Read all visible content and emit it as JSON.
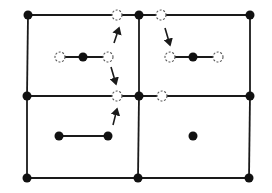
{
  "diagram": {
    "colors": {
      "line": "#1a1a1a",
      "filled_node": "#111111",
      "hollow_node_stroke": "#555555",
      "background": "#ffffff"
    },
    "grid_nodes": [
      {
        "id": "tl",
        "x": 28,
        "y": 15
      },
      {
        "id": "tc",
        "x": 139,
        "y": 15
      },
      {
        "id": "tr",
        "x": 250,
        "y": 15
      },
      {
        "id": "ml",
        "x": 27,
        "y": 96
      },
      {
        "id": "mc",
        "x": 139,
        "y": 96
      },
      {
        "id": "mr",
        "x": 250,
        "y": 96
      },
      {
        "id": "bl",
        "x": 27,
        "y": 178
      },
      {
        "id": "bc",
        "x": 138,
        "y": 178
      },
      {
        "id": "br",
        "x": 249,
        "y": 178
      }
    ],
    "grid_edges": [
      [
        "tl",
        "tc"
      ],
      [
        "tc",
        "tr"
      ],
      [
        "ml",
        "mc"
      ],
      [
        "mc",
        "mr"
      ],
      [
        "bl",
        "bc"
      ],
      [
        "bc",
        "br"
      ],
      [
        "tl",
        "ml"
      ],
      [
        "ml",
        "bl"
      ],
      [
        "tc",
        "mc"
      ],
      [
        "mc",
        "bc"
      ],
      [
        "tr",
        "mr"
      ],
      [
        "mr",
        "br"
      ]
    ],
    "hollow_nodes": [
      {
        "id": "h_top_left",
        "x": 117,
        "y": 15
      },
      {
        "id": "h_top_right",
        "x": 161,
        "y": 15
      },
      {
        "id": "h_mid_left",
        "x": 117,
        "y": 96
      },
      {
        "id": "h_mid_right",
        "x": 162,
        "y": 96
      },
      {
        "id": "h_d1_left",
        "x": 60,
        "y": 57
      },
      {
        "id": "h_d1_right",
        "x": 108,
        "y": 57
      },
      {
        "id": "h_d2_left",
        "x": 170,
        "y": 57
      },
      {
        "id": "h_d2_right",
        "x": 218,
        "y": 57
      }
    ],
    "inner_filled_nodes": [
      {
        "id": "f_d1_center",
        "x": 83,
        "y": 57
      },
      {
        "id": "f_d2_center",
        "x": 193,
        "y": 57
      },
      {
        "id": "f_d3_left",
        "x": 59,
        "y": 136
      },
      {
        "id": "f_d3_right",
        "x": 108,
        "y": 136
      },
      {
        "id": "f_single",
        "x": 193,
        "y": 136
      }
    ],
    "dumbbell_bonds": [
      {
        "x1": 60,
        "y1": 57,
        "x2": 108,
        "y2": 57
      },
      {
        "x1": 170,
        "y1": 57,
        "x2": 218,
        "y2": 57
      },
      {
        "x1": 59,
        "y1": 136,
        "x2": 108,
        "y2": 136
      }
    ],
    "arrows": [
      {
        "id": "arrow-up-top-left",
        "x1": 114,
        "y1": 43,
        "x2": 119,
        "y2": 28
      },
      {
        "id": "arrow-down-mid-left",
        "x1": 111,
        "y1": 67,
        "x2": 116,
        "y2": 84
      },
      {
        "id": "arrow-down-top-right",
        "x1": 165,
        "y1": 28,
        "x2": 170,
        "y2": 45
      },
      {
        "id": "arrow-up-bottom-left",
        "x1": 113,
        "y1": 125,
        "x2": 117,
        "y2": 109
      }
    ]
  }
}
